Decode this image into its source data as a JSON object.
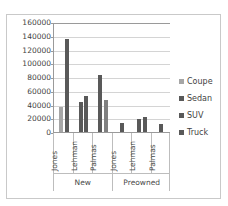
{
  "chart_data": {
    "type": "bar",
    "title": "",
    "xlabel": "",
    "ylabel": "",
    "ylim": [
      0,
      160000
    ],
    "ytick_step": 20000,
    "yticks": [
      "160000",
      "140000",
      "120000",
      "100000",
      "80000",
      "60000",
      "40000",
      "20000",
      "0"
    ],
    "grid": true,
    "legend_position": "right",
    "group_labels": [
      "New",
      "Preowned"
    ],
    "categories": [
      "Jones",
      "Lehman",
      "Palmas",
      "Jones",
      "Lehman",
      "Palmas"
    ],
    "series": [
      {
        "name": "Coupe",
        "color": "#a6a6a6",
        "values": [
          37000,
          null,
          47000,
          null,
          null,
          null
        ]
      },
      {
        "name": "Sedan",
        "color": "#595959",
        "values": [
          135000,
          43000,
          83000,
          13000,
          19000,
          12000
        ]
      },
      {
        "name": "SUV",
        "color": "#595959",
        "values": [
          null,
          52000,
          null,
          null,
          22000,
          null
        ]
      },
      {
        "name": "Truck",
        "color": "#595959",
        "values": [
          null,
          null,
          null,
          null,
          null,
          null
        ]
      }
    ],
    "bars": [
      {
        "group": 0,
        "category": "Jones",
        "group_label": "New",
        "series": "Coupe",
        "value": 37000,
        "color": "#a6a6a6"
      },
      {
        "group": 0,
        "category": "Jones",
        "group_label": "New",
        "series": "Sedan",
        "value": 135000,
        "color": "#595959"
      },
      {
        "group": 1,
        "category": "Lehman",
        "group_label": "New",
        "series": "Sedan",
        "value": 43000,
        "color": "#595959"
      },
      {
        "group": 1,
        "category": "Lehman",
        "group_label": "New",
        "series": "SUV",
        "value": 52000,
        "color": "#595959"
      },
      {
        "group": 2,
        "category": "Palmas",
        "group_label": "New",
        "series": "Sedan",
        "value": 83000,
        "color": "#595959"
      },
      {
        "group": 2,
        "category": "Palmas",
        "group_label": "New",
        "series": "Coupe",
        "value": 47000,
        "color": "#808080"
      },
      {
        "group": 3,
        "category": "Jones",
        "group_label": "Preowned",
        "series": "Sedan",
        "value": 13000,
        "color": "#595959"
      },
      {
        "group": 4,
        "category": "Lehman",
        "group_label": "Preowned",
        "series": "Sedan",
        "value": 19000,
        "color": "#595959"
      },
      {
        "group": 4,
        "category": "Lehman",
        "group_label": "Preowned",
        "series": "SUV",
        "value": 22000,
        "color": "#595959"
      },
      {
        "group": 5,
        "category": "Palmas",
        "group_label": "Preowned",
        "series": "Sedan",
        "value": 12000,
        "color": "#595959"
      }
    ],
    "legend": [
      {
        "label": "Coupe",
        "color": "#a6a6a6"
      },
      {
        "label": "Sedan",
        "color": "#595959"
      },
      {
        "label": "SUV",
        "color": "#595959"
      },
      {
        "label": "Truck",
        "color": "#595959"
      }
    ]
  }
}
